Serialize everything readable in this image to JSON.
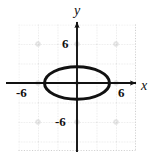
{
  "figure": {
    "kind": "coordinate-grid-graph",
    "background_color": "#ffffff",
    "ink_color": "#111111",
    "grid_color": "#c9c9c9",
    "grid_marker_color": "#bdbdbd"
  },
  "axes": {
    "x_label": "x",
    "y_label": "y",
    "x_ticks": [
      {
        "label": "-6",
        "value": -6
      },
      {
        "label": "6",
        "value": 6
      }
    ],
    "y_ticks": [
      {
        "label": "6",
        "value": 6
      },
      {
        "label": "-6",
        "value": -6
      }
    ]
  },
  "chart_data": {
    "type": "line",
    "title": "",
    "subtitle": "",
    "xlabel": "x",
    "ylabel": "y",
    "xlim": [
      -9,
      9
    ],
    "ylim": [
      -9,
      9
    ],
    "grid": true,
    "grid_spacing": 3,
    "legend": "none",
    "xticks": [
      -6,
      6
    ],
    "xticklabels": [
      "-6",
      "6"
    ],
    "yticks": [
      -6,
      6
    ],
    "yticklabels": [
      "-6",
      "6"
    ],
    "annotations": [],
    "series": [
      {
        "name": "ellipse",
        "shape": "ellipse",
        "center": [
          0,
          0
        ],
        "semi_axis_x": 6,
        "semi_axis_y": 3,
        "equation": "x^2/36 + y^2/9 = 1",
        "stroke": "#111111",
        "stroke_width": 3,
        "fill": "none",
        "x": [
          -6,
          -5,
          -4,
          -3,
          -2,
          -1,
          0,
          1,
          2,
          3,
          4,
          5,
          6,
          5,
          4,
          3,
          2,
          1,
          0,
          -1,
          -2,
          -3,
          -4,
          -5,
          -6
        ],
        "y": [
          0,
          1.66,
          2.24,
          2.6,
          2.83,
          2.96,
          3,
          2.96,
          2.83,
          2.6,
          2.24,
          1.66,
          0,
          -1.66,
          -2.24,
          -2.6,
          -2.83,
          -2.96,
          -3,
          -2.96,
          -2.83,
          -2.6,
          -2.24,
          -1.66,
          0
        ]
      }
    ]
  }
}
